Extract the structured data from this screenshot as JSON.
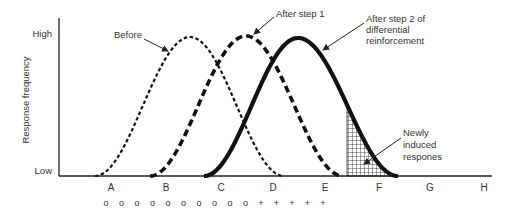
{
  "diagram": {
    "y_axis": {
      "title": "Response frequency",
      "high_label": "High",
      "low_label": "Low"
    },
    "x_axis": {
      "ticks": [
        {
          "label": "A",
          "x": 111
        },
        {
          "label": "B",
          "x": 166
        },
        {
          "label": "C",
          "x": 221
        },
        {
          "label": "D",
          "x": 273
        },
        {
          "label": "E",
          "x": 325
        },
        {
          "label": "F",
          "x": 379
        },
        {
          "label": "G",
          "x": 430
        },
        {
          "label": "H",
          "x": 484
        }
      ]
    },
    "stimulus_row": {
      "symbols": [
        "o",
        "o",
        "o",
        "o",
        "o",
        "o",
        "o",
        "o",
        "o",
        "o",
        "+",
        "+",
        "+",
        "+",
        "+"
      ],
      "start_x": 106,
      "spacing": 15.5,
      "y": 206
    },
    "curves": [
      {
        "name": "before",
        "label": "Before",
        "style": "fine-dashed",
        "start_x": 95,
        "peak_x": 190,
        "end_x": 284,
        "peak_y": 37,
        "stroke_width": 2.2,
        "dash": "3.5 2.5"
      },
      {
        "name": "after-step-1",
        "label": "After step 1",
        "style": "heavy-dashed",
        "start_x": 150,
        "peak_x": 246,
        "end_x": 343,
        "peak_y": 36,
        "stroke_width": 3.6,
        "dash": "7 4"
      },
      {
        "name": "after-step-2",
        "label": "After step 2 of differential reinforcement",
        "style": "solid-bold",
        "start_x": 204,
        "peak_x": 298,
        "end_x": 398,
        "peak_y": 38,
        "stroke_width": 4.2,
        "dash": ""
      }
    ],
    "annotations": {
      "before": {
        "lines": [
          "Before"
        ],
        "x": 114,
        "y": 38,
        "arrow": [
          144,
          39,
          168,
          51
        ]
      },
      "after_step_1": {
        "lines": [
          "After step 1"
        ],
        "x": 276,
        "y": 17,
        "arrow": [
          274,
          17,
          254,
          34
        ]
      },
      "after_step_2": {
        "lines": [
          "After step 2 of",
          "differential",
          "reinforcement"
        ],
        "x": 366,
        "y": 22,
        "line_height": 11,
        "arrow": [
          364,
          23,
          323,
          50
        ]
      },
      "newly_induced": {
        "lines": [
          "Newly",
          "induced",
          "respones"
        ],
        "x": 403,
        "y": 136,
        "line_height": 12,
        "arrow": [
          401,
          138,
          364,
          164
        ]
      }
    },
    "hatched_region": {
      "start_x": 347,
      "label": "Newly induced respones"
    },
    "colors": {
      "ink": "#111111",
      "text": "#333333",
      "axis": "#222222",
      "background": "#ffffff"
    }
  }
}
